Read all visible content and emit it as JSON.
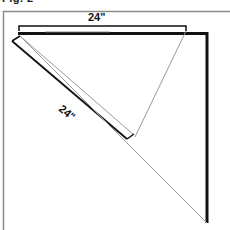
{
  "figure": {
    "label": "Fig. 2",
    "top_dimension": "24\"",
    "diagonal_dimension": "24\""
  },
  "colors": {
    "frame": "#8a8a8a",
    "board": "#111111",
    "guide": "#9a9a9a",
    "text": "#111111"
  }
}
